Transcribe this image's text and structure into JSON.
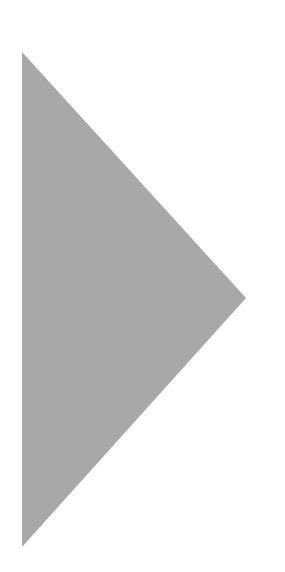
{
  "icon": {
    "name": "play-triangle",
    "color": "#a8a8a8",
    "background": "#ffffff",
    "points": [
      [
        22,
        52
      ],
      [
        246,
        298
      ],
      [
        22,
        547
      ]
    ]
  }
}
